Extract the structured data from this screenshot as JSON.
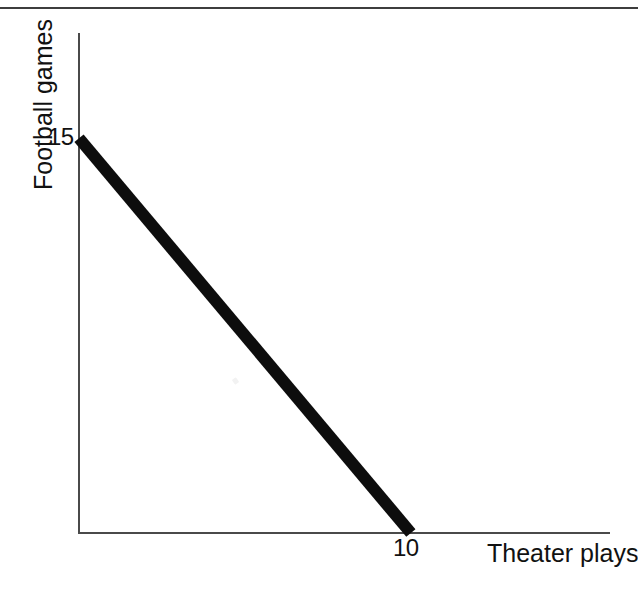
{
  "figure": {
    "background_color": "#ffffff",
    "axis_color": "#4a4a4a",
    "line_color": "#0d0d0d",
    "page_rule_color": "#3d3d3d"
  },
  "axes": {
    "y_title": "Football games",
    "x_title": "Theater plays",
    "y_tick_label": "15",
    "x_tick_label": "10"
  },
  "chart_data": {
    "type": "line",
    "title": "",
    "subtitle": "",
    "xlabel": "Theater plays",
    "ylabel": "Football games",
    "xlim": [
      0,
      16
    ],
    "ylim": [
      0,
      19
    ],
    "grid": false,
    "legend": null,
    "xticks": [
      10
    ],
    "xticklabels": [
      "10"
    ],
    "yticks": [
      15
    ],
    "yticklabels": [
      "15"
    ],
    "series": [
      {
        "name": "Budget constraint",
        "x": [
          0,
          10
        ],
        "y": [
          15,
          0
        ],
        "style": "solid",
        "linewidth_px": 12,
        "color": "#0d0d0d"
      }
    ],
    "annotations": []
  }
}
